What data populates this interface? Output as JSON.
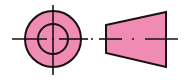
{
  "diagram": {
    "views": [
      {
        "name": "end-view",
        "shape": "concentric circles with crosshair center lines"
      },
      {
        "name": "side-view",
        "shape": "trapezoid with axis center line"
      }
    ],
    "colors": {
      "fill": "#f08cb4",
      "stroke": "#1a1014",
      "background": "#ffffff"
    }
  }
}
